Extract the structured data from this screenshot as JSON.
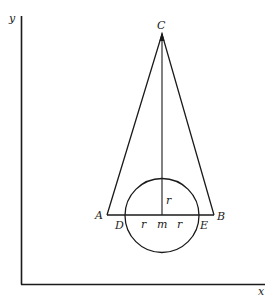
{
  "diagram": {
    "axes": {
      "x_label": "x",
      "y_label": "y"
    },
    "points": {
      "apex": "C",
      "base_left": "A",
      "base_right": "B",
      "circle_left": "D",
      "circle_right": "E",
      "center": "m"
    },
    "radius_labels": {
      "vertical": "r",
      "left": "r",
      "right": "r"
    },
    "colors": {
      "line": "#1a1a1a",
      "background": "#ffffff"
    }
  }
}
